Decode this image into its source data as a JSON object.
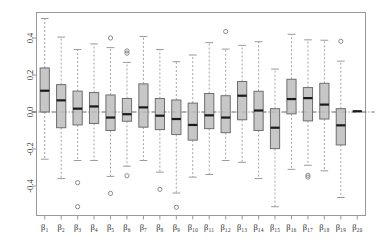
{
  "chart_data": {
    "type": "box",
    "title": "",
    "xlabel": "",
    "ylabel": "",
    "ylim": [
      -0.58,
      0.53
    ],
    "yticks": [
      0.4,
      0.2,
      0.0,
      -0.2,
      -0.4
    ],
    "ytick_labels": [
      "0.4",
      "0.2",
      "0.0",
      "-0.2",
      "-0.4"
    ],
    "grid": false,
    "legend": null,
    "reference_line": {
      "y": 0.0,
      "style": "dashdot"
    },
    "categories": [
      "β₁",
      "β₂",
      "β₃",
      "β₄",
      "β₅",
      "β₆",
      "β₇",
      "β₈",
      "β₉",
      "β₁₀",
      "β₁₁",
      "β₁₂",
      "β₁₃",
      "β₁₄",
      "β₁₅",
      "β₁₆",
      "β₁₇",
      "β₁₈",
      "β₁₉",
      "β₂₀"
    ],
    "boxes": [
      {
        "label": "β₁",
        "whisker_low": -0.255,
        "q1": 0.0,
        "median": 0.115,
        "q3": 0.238,
        "whisker_high": 0.505,
        "outliers": []
      },
      {
        "label": "β₂",
        "whisker_low": -0.36,
        "q1": -0.085,
        "median": 0.063,
        "q3": 0.148,
        "whisker_high": 0.405,
        "outliers": []
      },
      {
        "label": "β₃",
        "whisker_low": -0.262,
        "q1": -0.07,
        "median": 0.018,
        "q3": 0.113,
        "whisker_high": 0.338,
        "outliers": [
          -0.382,
          -0.512
        ]
      },
      {
        "label": "β₄",
        "whisker_low": -0.262,
        "q1": -0.062,
        "median": 0.03,
        "q3": 0.105,
        "whisker_high": 0.368,
        "outliers": []
      },
      {
        "label": "β₅",
        "whisker_low": -0.348,
        "q1": -0.1,
        "median": -0.03,
        "q3": 0.092,
        "whisker_high": 0.348,
        "outliers": [
          0.4,
          -0.44
        ]
      },
      {
        "label": "β₆",
        "whisker_low": -0.293,
        "q1": -0.05,
        "median": -0.012,
        "q3": 0.073,
        "whisker_high": 0.268,
        "outliers": [
          0.318,
          0.33,
          -0.345
        ]
      },
      {
        "label": "β₇",
        "whisker_low": -0.262,
        "q1": -0.082,
        "median": 0.025,
        "q3": 0.152,
        "whisker_high": 0.408,
        "outliers": []
      },
      {
        "label": "β₈",
        "whisker_low": -0.325,
        "q1": -0.095,
        "median": -0.02,
        "q3": 0.073,
        "whisker_high": 0.338,
        "outliers": [
          -0.418
        ]
      },
      {
        "label": "β₉",
        "whisker_low": -0.438,
        "q1": -0.122,
        "median": -0.038,
        "q3": 0.065,
        "whisker_high": 0.272,
        "outliers": [
          -0.515
        ]
      },
      {
        "label": "β₁₀",
        "whisker_low": -0.352,
        "q1": -0.152,
        "median": -0.07,
        "q3": 0.048,
        "whisker_high": 0.308,
        "outliers": []
      },
      {
        "label": "β₁₁",
        "whisker_low": -0.338,
        "q1": -0.09,
        "median": -0.018,
        "q3": 0.1,
        "whisker_high": 0.375,
        "outliers": []
      },
      {
        "label": "β₁₂",
        "whisker_low": -0.262,
        "q1": -0.112,
        "median": -0.03,
        "q3": 0.088,
        "whisker_high": 0.34,
        "outliers": [
          0.435
        ]
      },
      {
        "label": "β₁₃",
        "whisker_low": -0.272,
        "q1": -0.042,
        "median": 0.088,
        "q3": 0.165,
        "whisker_high": 0.36,
        "outliers": []
      },
      {
        "label": "β₁₄",
        "whisker_low": -0.36,
        "q1": -0.1,
        "median": 0.008,
        "q3": 0.112,
        "whisker_high": 0.38,
        "outliers": []
      },
      {
        "label": "β₁₅",
        "whisker_low": -0.512,
        "q1": -0.198,
        "median": -0.085,
        "q3": 0.018,
        "whisker_high": 0.232,
        "outliers": []
      },
      {
        "label": "β₁₆",
        "whisker_low": -0.31,
        "q1": -0.01,
        "median": 0.07,
        "q3": 0.177,
        "whisker_high": 0.42,
        "outliers": []
      },
      {
        "label": "β₁₇",
        "whisker_low": -0.288,
        "q1": -0.048,
        "median": 0.075,
        "q3": 0.132,
        "whisker_high": 0.39,
        "outliers": [
          -0.342,
          -0.352
        ]
      },
      {
        "label": "β₁₈",
        "whisker_low": -0.318,
        "q1": -0.038,
        "median": 0.04,
        "q3": 0.155,
        "whisker_high": 0.388,
        "outliers": []
      },
      {
        "label": "β₁₉",
        "whisker_low": -0.462,
        "q1": -0.178,
        "median": -0.072,
        "q3": 0.018,
        "whisker_high": 0.275,
        "outliers": [
          0.382
        ]
      },
      {
        "label": "β₂₀",
        "whisker_low": 0.002,
        "q1": 0.002,
        "median": 0.004,
        "q3": 0.006,
        "whisker_high": 0.006,
        "outliers": []
      }
    ]
  },
  "style": {
    "box_fill": "#bdbdbd",
    "box_stroke": "#6e6e6e",
    "median_color": "#1a1a1a",
    "whisker_color": "#9a9a9a",
    "outlier_color": "#8a8a8a",
    "frame_color": "#9a9a9a",
    "text_color": "#2b2b2b",
    "reference_line_color": "#555555",
    "background": "#ffffff"
  }
}
